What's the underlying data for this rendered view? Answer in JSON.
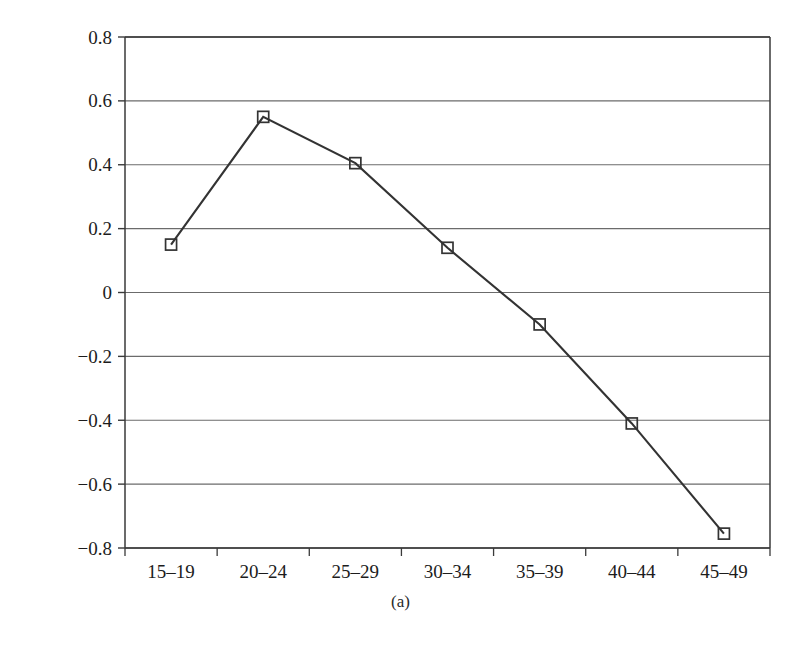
{
  "chart_data": {
    "type": "line",
    "title": "",
    "subtitle": "",
    "xlabel": "",
    "ylabel": "Logged Homicide Rate",
    "caption": "(a)",
    "categories": [
      "15–19",
      "20–24",
      "25–29",
      "30–34",
      "35–39",
      "40–44",
      "45–49"
    ],
    "values": [
      0.15,
      0.55,
      0.405,
      0.14,
      -0.1,
      -0.41,
      -0.755
    ],
    "series": [
      {
        "name": "Logged Homicide Rate",
        "values": [
          0.15,
          0.55,
          0.405,
          0.14,
          -0.1,
          -0.41,
          -0.755
        ]
      }
    ],
    "ylim": [
      -0.8,
      0.8
    ],
    "yticks": [
      0.8,
      0.6,
      0.4,
      0.2,
      0,
      -0.2,
      -0.4,
      -0.6,
      -0.8
    ],
    "ytick_labels": [
      "0.8",
      "0.6",
      "0.4",
      "0.2",
      "0",
      "−0.2",
      "−0.4",
      "−0.6",
      "−0.8"
    ],
    "grid": "horizontal",
    "legend": "none",
    "marker": "square",
    "line_color": "#333333",
    "marker_color": "#333333",
    "grid_color": "#6b6b6b",
    "axis_color": "#3a3a3a",
    "background": "#ffffff"
  }
}
